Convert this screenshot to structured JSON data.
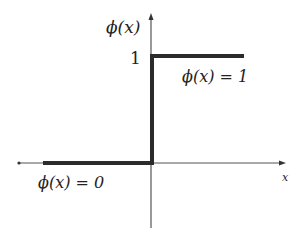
{
  "diagram": {
    "type": "step_function",
    "y_axis_label": "ϕ(x)",
    "x_axis_label": "x",
    "y_tick_label": "1",
    "upper_annotation": "ϕ(x) = 1",
    "lower_annotation": "ϕ(x) = 0",
    "colors": {
      "axis": "#555555",
      "step_line": "#2b2b2b",
      "text": "#222222"
    }
  }
}
